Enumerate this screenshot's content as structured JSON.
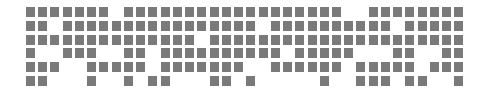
{
  "grid": {
    "columns": 36,
    "rows": 6,
    "origin_x": 26,
    "origin_y": 7,
    "pitch_x": 12.24,
    "pitch_y": 13.8,
    "cell_color": "#7a7a7a",
    "background": "#ffffff",
    "filled": [
      [
        0,
        1,
        2,
        3,
        4,
        5,
        6,
        8,
        9,
        10,
        11,
        12,
        13,
        14,
        15,
        16,
        17,
        18,
        19,
        20,
        21,
        22,
        23,
        24,
        25,
        28,
        29,
        30,
        31,
        32,
        33,
        34,
        35
      ],
      [
        0,
        1,
        3,
        4,
        5,
        6,
        7,
        8,
        9,
        10,
        11,
        12,
        13,
        14,
        15,
        16,
        17,
        18,
        20,
        21,
        22,
        23,
        24,
        25,
        26,
        27,
        28,
        29,
        31,
        32,
        33,
        34,
        35
      ],
      [
        0,
        1,
        2,
        3,
        4,
        5,
        6,
        7,
        8,
        9,
        10,
        11,
        12,
        13,
        15,
        16,
        17,
        18,
        19,
        20,
        21,
        22,
        23,
        24,
        25,
        26,
        27,
        28,
        29,
        30,
        31,
        32,
        33,
        34,
        35
      ],
      [
        0,
        3,
        4,
        5,
        8,
        9,
        11,
        12,
        13,
        14,
        15,
        16,
        17,
        18,
        19,
        20,
        22,
        23,
        24,
        25,
        26,
        30,
        31,
        34,
        35
      ],
      [
        0,
        1,
        2,
        5,
        6,
        7,
        8,
        9,
        11,
        12,
        13,
        14,
        15,
        16,
        17,
        20,
        21,
        22,
        23,
        24,
        25,
        27,
        28,
        29,
        30,
        31,
        33,
        34,
        35
      ],
      [
        0,
        1,
        5,
        8,
        10,
        11,
        15,
        16,
        18,
        24,
        27,
        28,
        29,
        31,
        32,
        35
      ]
    ]
  }
}
